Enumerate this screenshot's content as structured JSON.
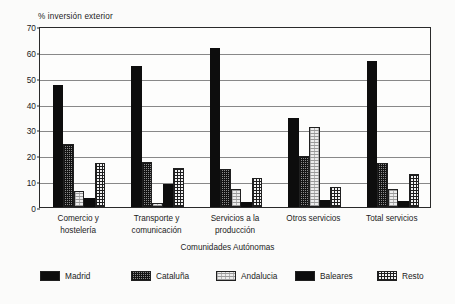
{
  "chart_data": {
    "type": "bar",
    "title": "% inversión exterior",
    "ylabel": "% inversión exterior",
    "xlabel": "Comunidades Autónomas",
    "ylim": [
      0,
      70
    ],
    "ytick_step": 10,
    "yticks": [
      0,
      10,
      20,
      30,
      40,
      50,
      60,
      70
    ],
    "grid": true,
    "legend_position": "bottom",
    "categories": [
      "Comercio y hostelería",
      "Transporte y comunicación",
      "Servicios a la producción",
      "Otros servicios",
      "Total servicios"
    ],
    "category_lines": [
      [
        "Comercio y",
        "hostelería"
      ],
      [
        "Transporte y",
        "comunicación"
      ],
      [
        "Servicios a la",
        "producción"
      ],
      [
        "Otros servicios"
      ],
      [
        "Total servicios"
      ]
    ],
    "series": [
      {
        "name": "Madrid",
        "pattern": "solid",
        "values": [
          47.3,
          54.4,
          61.4,
          34.4,
          56.3
        ]
      },
      {
        "name": "Cataluña",
        "pattern": "dense",
        "values": [
          24.4,
          17.6,
          14.8,
          19.9,
          17.1
        ]
      },
      {
        "name": "Andalucia",
        "pattern": "light",
        "values": [
          6.3,
          1.5,
          6.8,
          30.8,
          7.0
        ]
      },
      {
        "name": "Baleares",
        "pattern": "solid",
        "values": [
          3.4,
          9.0,
          2.0,
          2.9,
          2.2
        ]
      },
      {
        "name": "Resto",
        "pattern": "grid",
        "values": [
          17.2,
          15.0,
          11.3,
          7.8,
          12.7
        ]
      }
    ]
  },
  "legend": {
    "items": [
      {
        "label": "Madrid",
        "pattern": "solid"
      },
      {
        "label": "Cataluña",
        "pattern": "dense"
      },
      {
        "label": "Andalucia",
        "pattern": "light"
      },
      {
        "label": "Baleares",
        "pattern": "solid"
      },
      {
        "label": "Resto",
        "pattern": "grid"
      }
    ]
  },
  "colors": {
    "axis": "#2a2a2a",
    "grid": "#6e6e6e",
    "text": "#1c1c1c",
    "series_solid": "#0d0d0d",
    "series_dense": "#8d8d8d",
    "series_light": "#ededed",
    "series_grid": "#f2f2f2",
    "background": "#fbfbfa",
    "plot_background": "#fdfdfc"
  }
}
